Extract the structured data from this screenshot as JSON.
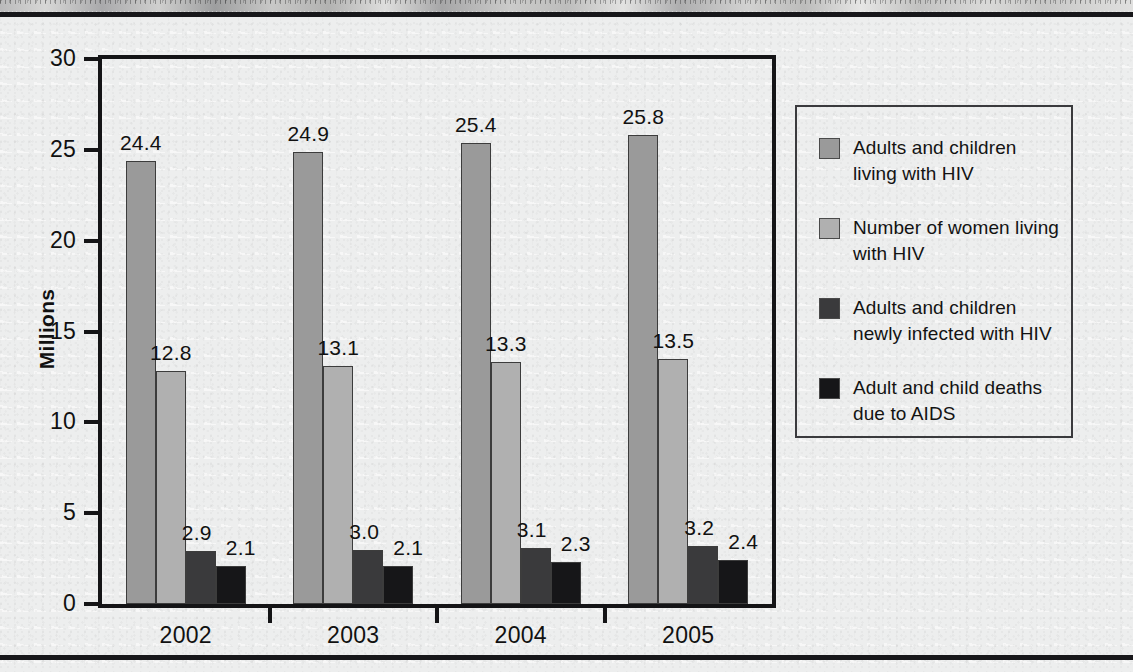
{
  "figure": {
    "background_color": "#edeeee",
    "rule_color": "#17171a",
    "axis_color": "#141416"
  },
  "axis": {
    "y_title": "Millions",
    "y_ticks": [
      "30",
      "25",
      "20",
      "15",
      "10",
      "5",
      "0"
    ],
    "x_labels": [
      "2002",
      "2003",
      "2004",
      "2005"
    ]
  },
  "legend": {
    "items": [
      {
        "label": "Adults and children living with HIV",
        "color": "#9a9a9a"
      },
      {
        "label": "Number of women living with HIV",
        "color": "#b0b0b0"
      },
      {
        "label": "Adults and children newly infected with HIV",
        "color": "#3a3a3c"
      },
      {
        "label": "Adult and child deaths due to AIDS",
        "color": "#161618"
      }
    ]
  },
  "chart_data": {
    "type": "bar",
    "title": "",
    "subtitle": "",
    "xlabel": "",
    "ylabel": "Millions",
    "ylim": [
      0,
      30
    ],
    "ytick_step": 5,
    "grid": false,
    "legend_position": "right",
    "categories": [
      "2002",
      "2003",
      "2004",
      "2005"
    ],
    "series": [
      {
        "name": "Adults and children living with HIV",
        "color": "#9a9a9a",
        "values": [
          24.4,
          24.9,
          25.4,
          25.8
        ],
        "labels": [
          "24.4",
          "24.9",
          "25.4",
          "25.8"
        ]
      },
      {
        "name": "Number of women living with HIV",
        "color": "#b0b0b0",
        "values": [
          12.8,
          13.1,
          13.3,
          13.5
        ],
        "labels": [
          "12.8",
          "13.1",
          "13.3",
          "13.5"
        ]
      },
      {
        "name": "Adults and children newly infected with HIV",
        "color": "#3a3a3c",
        "values": [
          2.9,
          3.0,
          3.1,
          3.2
        ],
        "labels": [
          "2.9",
          "3.0",
          "3.1",
          "3.2"
        ]
      },
      {
        "name": "Adult and child deaths due to AIDS",
        "color": "#161618",
        "values": [
          2.1,
          2.1,
          2.3,
          2.4
        ],
        "labels": [
          "2.1",
          "2.1",
          "2.3",
          "2.4"
        ]
      }
    ]
  }
}
